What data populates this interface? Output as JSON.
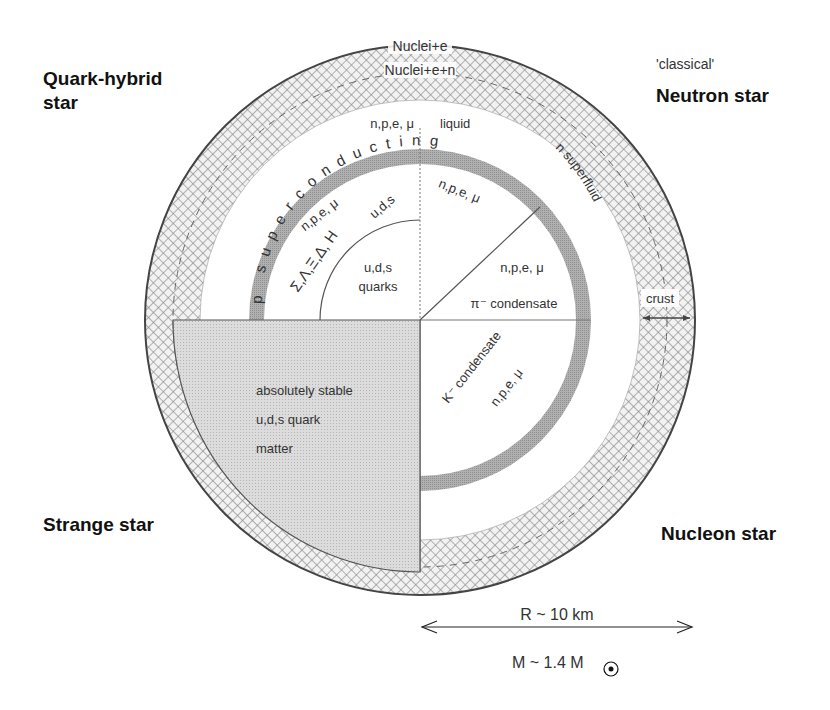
{
  "corner_labels": {
    "top_left": {
      "line1": "Quark-hybrid",
      "line2": "star"
    },
    "top_right_sub": "'classical'",
    "top_right": "Neutron star",
    "bottom_left": "Strange star",
    "bottom_right": "Nucleon star"
  },
  "crust": {
    "outer_label": "Nuclei+e",
    "inner_label": "Nuclei+e+n",
    "crust_label": "crust"
  },
  "liquid_region": {
    "particles": "n,p,e, μ",
    "state": "liquid"
  },
  "superconducting_band": {
    "text": "p superconducting",
    "letters": [
      "p",
      "s",
      "u",
      "p",
      "e",
      "r",
      "c",
      "o",
      "n",
      "d",
      "u",
      "c",
      "t",
      "i",
      "n",
      "g"
    ]
  },
  "quark_hybrid": {
    "hadrons_particles": "n,p,e, μ",
    "hyperons": "Σ,Λ,Ξ,Δ, H",
    "uds_ring": "u,d,s",
    "core_line1": "u,d,s",
    "core_line2": "quarks"
  },
  "neutron_star": {
    "superfluid_label": "n superfluid",
    "upper_particles": "n,p,e, μ",
    "lower_particles": "n,p,e, μ",
    "pion_condensate": "π⁻ condensate"
  },
  "strange_star": {
    "line1": "absolutely stable",
    "line2": "u,d,s  quark",
    "line3": "matter"
  },
  "nucleon_star": {
    "kaon_condensate": "K⁻ condensate",
    "particles": "n,p,e, μ"
  },
  "scale": {
    "radius": "R ~ 10 km",
    "mass_prefix": "M ~ 1.4 M",
    "sun_symbol": "⊙"
  },
  "colors": {
    "outline": "#555555",
    "band_gray": "#a8a8a8",
    "strange_fill": "#d6d6d6",
    "crust_hatch": "#8a8a8a"
  }
}
